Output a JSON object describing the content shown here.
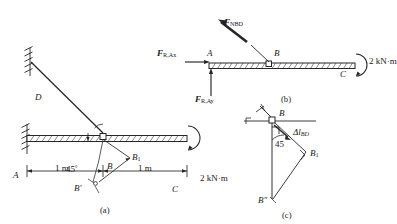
{
  "figure": {
    "type": "structural-mechanics-diagram",
    "ink_color": "#262626",
    "subfigures": [
      {
        "id": "a",
        "caption": "(a)",
        "description": "Cantilever beam AC fixed at A with inclined rod BD at 45 degrees, moment 2 kN·m applied at C",
        "labels": {
          "support_D": "D",
          "support_A": "A",
          "joint_B": "B",
          "end_C": "C",
          "angle": "45",
          "angle_unit": "°",
          "moment": "2 kN·m",
          "dim_left": "1 m",
          "dim_right": "1 m",
          "point_B1_base": "B",
          "point_B1_sub": "1",
          "point_Bprime": "B",
          "point_Bprime_mark": "′"
        }
      },
      {
        "id": "b",
        "caption": "(b)",
        "description": "Free body diagram of beam AC with reaction forces at A and rod force at B",
        "labels": {
          "force_rod_base": "F",
          "force_rod_sub": "NBD",
          "force_Ax_base": "F",
          "force_Ax_sub": "R,Ax",
          "force_Ay_base": "F",
          "force_Ay_sub": "R,Ay",
          "point_A": "A",
          "point_B": "B",
          "point_C": "C",
          "moment": "2 kN·m"
        }
      },
      {
        "id": "c",
        "caption": "(c)",
        "description": "Displacement compatibility diagram at joint B showing elongation of rod BD",
        "labels": {
          "point_B": "B",
          "elongation_delta": "Δ",
          "elongation_l": "l",
          "elongation_sub": "BD",
          "angle": "45",
          "point_B1_base": "B",
          "point_B1_sub": "1",
          "point_Bsec": "B",
          "point_Bsec_mark": "″"
        }
      }
    ]
  }
}
